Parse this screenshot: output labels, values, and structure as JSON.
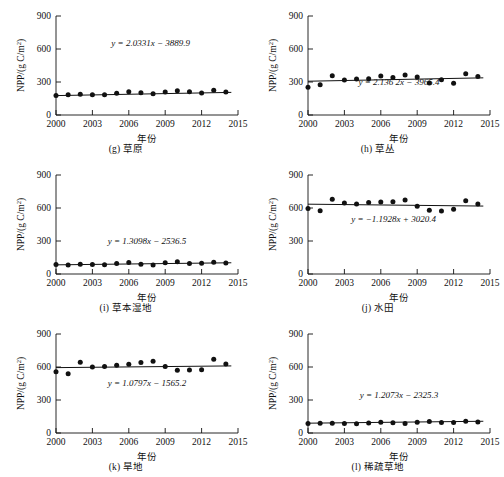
{
  "figure": {
    "axis": {
      "y_title_prefix": "NPP/(g C/m",
      "y_title_sup": "2",
      "y_title_suffix": ")",
      "x_title": "年份",
      "y_ticks": [
        "0",
        "300",
        "600",
        "900"
      ],
      "x_ticks": [
        "2000",
        "2003",
        "2006",
        "2009",
        "2012",
        "2015"
      ],
      "ylim_min": 0,
      "ylim_max": 900,
      "xlim_min": 2000,
      "xlim_max": 2015
    },
    "marker_color": "#111111",
    "line_color": "#111111"
  },
  "chart_data": [
    {
      "type": "scatter",
      "panel_id": "g",
      "caption": "(g) 草原",
      "title": "草原",
      "equation": "y = 2.0331x − 3889.9",
      "slope": 2.0331,
      "intercept": -3889.9,
      "xlabel": "年份",
      "ylabel": "NPP/(g C/m2)",
      "xlim": [
        2000,
        2015
      ],
      "ylim": [
        0,
        900
      ],
      "grid": false,
      "legend": "none",
      "x": [
        2000,
        2001,
        2002,
        2003,
        2004,
        2005,
        2006,
        2007,
        2008,
        2009,
        2010,
        2011,
        2012,
        2013,
        2014
      ],
      "values": [
        178,
        183,
        188,
        185,
        183,
        197,
        211,
        203,
        193,
        210,
        220,
        211,
        199,
        224,
        208
      ]
    },
    {
      "type": "scatter",
      "panel_id": "h",
      "caption": "(h) 草丛",
      "title": "草丛",
      "equation": "y = 2.136 2x − 3965.4",
      "slope": 2.1362,
      "intercept": -3965.4,
      "xlabel": "年份",
      "ylabel": "NPP/(g C/m2)",
      "xlim": [
        2000,
        2015
      ],
      "ylim": [
        0,
        900
      ],
      "grid": false,
      "legend": "none",
      "x": [
        2000,
        2001,
        2002,
        2003,
        2004,
        2005,
        2006,
        2007,
        2008,
        2009,
        2010,
        2011,
        2012,
        2013,
        2014
      ],
      "values": [
        253,
        276,
        356,
        318,
        327,
        330,
        355,
        340,
        364,
        345,
        292,
        320,
        288,
        376,
        349
      ]
    },
    {
      "type": "scatter",
      "panel_id": "i",
      "caption": "(i) 草本湿地",
      "title": "草本湿地",
      "equation": "y = 1.3098x − 2536.5",
      "slope": 1.3098,
      "intercept": -2536.5,
      "xlabel": "年份",
      "ylabel": "NPP/(g C/m2)",
      "xlim": [
        2000,
        2015
      ],
      "ylim": [
        0,
        900
      ],
      "grid": false,
      "legend": "none",
      "x": [
        2000,
        2001,
        2002,
        2003,
        2004,
        2005,
        2006,
        2007,
        2008,
        2009,
        2010,
        2011,
        2012,
        2013,
        2014
      ],
      "values": [
        86,
        82,
        88,
        86,
        84,
        95,
        104,
        88,
        82,
        103,
        112,
        95,
        98,
        107,
        99
      ]
    },
    {
      "type": "scatter",
      "panel_id": "j",
      "caption": "(j) 水田",
      "title": "水田",
      "equation": "y = −1.1928x + 3020.4",
      "slope": -1.1928,
      "intercept": 3020.4,
      "xlabel": "年份",
      "ylabel": "NPP/(g C/m2)",
      "xlim": [
        2000,
        2015
      ],
      "ylim": [
        0,
        900
      ],
      "grid": false,
      "legend": "none",
      "x": [
        2000,
        2001,
        2002,
        2003,
        2004,
        2005,
        2006,
        2007,
        2008,
        2009,
        2010,
        2011,
        2012,
        2013,
        2014
      ],
      "values": [
        595,
        576,
        680,
        645,
        637,
        650,
        655,
        657,
        672,
        617,
        580,
        573,
        588,
        665,
        637
      ]
    },
    {
      "type": "scatter",
      "panel_id": "k",
      "caption": "(k) 旱地",
      "title": "旱地",
      "equation": "y = 1.0797x − 1565.2",
      "slope": 1.0797,
      "intercept": -1565.2,
      "xlabel": "年份",
      "ylabel": "NPP/(g C/m2)",
      "xlim": [
        2000,
        2015
      ],
      "ylim": [
        0,
        900
      ],
      "grid": false,
      "legend": "none",
      "x": [
        2000,
        2001,
        2002,
        2003,
        2004,
        2005,
        2006,
        2007,
        2008,
        2009,
        2010,
        2011,
        2012,
        2013,
        2014
      ],
      "values": [
        556,
        538,
        644,
        600,
        604,
        615,
        625,
        640,
        652,
        605,
        570,
        573,
        574,
        670,
        628
      ]
    },
    {
      "type": "scatter",
      "panel_id": "l",
      "caption": "(l) 稀疏草地",
      "title": "稀疏草地",
      "equation": "y = 1.2073x − 2325.3",
      "slope": 1.2073,
      "intercept": -2325.3,
      "xlabel": "年份",
      "ylabel": "NPP/(g C/m2)",
      "xlim": [
        2000,
        2015
      ],
      "ylim": [
        0,
        900
      ],
      "grid": false,
      "legend": "none",
      "x": [
        2000,
        2001,
        2002,
        2003,
        2004,
        2005,
        2006,
        2007,
        2008,
        2009,
        2010,
        2011,
        2012,
        2013,
        2014
      ],
      "values": [
        86,
        88,
        89,
        86,
        84,
        90,
        97,
        93,
        87,
        97,
        104,
        95,
        96,
        106,
        100
      ]
    }
  ]
}
